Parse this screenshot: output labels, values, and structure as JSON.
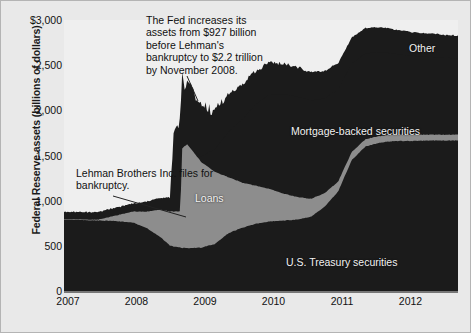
{
  "chart_data": {
    "type": "area",
    "title": "",
    "xlabel": "",
    "ylabel": "Federal Reserve assets (billions of dollars)",
    "ylim": [
      0,
      3000
    ],
    "yticks": [
      "0",
      "500",
      "1,000",
      "1,500",
      "2,000",
      "2,500",
      "$3,000"
    ],
    "ytick_values": [
      0,
      500,
      1000,
      1500,
      2000,
      2500,
      3000
    ],
    "xlim": [
      2007,
      2012.75
    ],
    "xticks": [
      "2007",
      "2008",
      "2009",
      "2010",
      "2011",
      "2012"
    ],
    "xtick_values": [
      2007,
      2008,
      2009,
      2010,
      2011,
      2012
    ],
    "grid": false,
    "legend_position": "inline-labels",
    "stacking": "stacked-area",
    "colors": {
      "us_treasury_securities": "#1b1b1b",
      "loans": "#8d8d8d",
      "mortgage_backed_securities": "#1b1b1b",
      "other": "#1b1b1b",
      "background": "#e9e9e9",
      "plot_background": "#efefef",
      "text": "#111111",
      "series_label_text": "#f2f2f2"
    },
    "series": [
      {
        "name": "U.S. Treasury securities",
        "x": [
          2007.0,
          2007.25,
          2007.5,
          2007.75,
          2008.0,
          2008.2,
          2008.4,
          2008.55,
          2008.7,
          2008.72,
          2008.8,
          2008.9,
          2009.0,
          2009.2,
          2009.4,
          2009.6,
          2009.8,
          2010.0,
          2010.2,
          2010.4,
          2010.6,
          2010.8,
          2011.0,
          2011.2,
          2011.4,
          2011.6,
          2011.8,
          2012.0,
          2012.3,
          2012.6,
          2012.75
        ],
        "values": [
          790,
          785,
          780,
          775,
          760,
          700,
          600,
          500,
          480,
          475,
          476,
          478,
          480,
          520,
          640,
          700,
          745,
          770,
          780,
          790,
          820,
          930,
          1100,
          1450,
          1600,
          1640,
          1660,
          1660,
          1665,
          1665,
          1665
        ]
      },
      {
        "name": "Loans",
        "x": [
          2007.0,
          2007.5,
          2007.75,
          2008.0,
          2008.2,
          2008.4,
          2008.55,
          2008.7,
          2008.72,
          2008.8,
          2008.9,
          2009.0,
          2009.2,
          2009.4,
          2009.6,
          2009.8,
          2010.0,
          2010.2,
          2010.4,
          2010.6,
          2010.8,
          2011.0,
          2011.2,
          2011.4,
          2011.6,
          2011.8,
          2012.0,
          2012.3,
          2012.6,
          2012.75
        ],
        "values": [
          5,
          10,
          60,
          120,
          180,
          300,
          380,
          400,
          1100,
          1150,
          1050,
          950,
          800,
          620,
          500,
          420,
          360,
          300,
          250,
          200,
          150,
          110,
          90,
          80,
          75,
          70,
          68,
          65,
          65,
          65
        ]
      },
      {
        "name": "Mortgage-backed securities",
        "x": [
          2007.0,
          2008.0,
          2008.7,
          2008.9,
          2009.0,
          2009.2,
          2009.4,
          2009.6,
          2009.8,
          2010.0,
          2010.2,
          2010.4,
          2010.6,
          2010.8,
          2011.0,
          2011.2,
          2011.4,
          2011.6,
          2011.8,
          2012.0,
          2012.3,
          2012.6,
          2012.75
        ],
        "values": [
          0,
          0,
          0,
          20,
          60,
          250,
          500,
          700,
          900,
          1050,
          1100,
          1110,
          1090,
          1050,
          1020,
          980,
          950,
          930,
          900,
          880,
          860,
          850,
          845
        ]
      },
      {
        "name": "Other",
        "x": [
          2007.0,
          2007.5,
          2008.0,
          2008.3,
          2008.55,
          2008.6,
          2008.7,
          2008.75,
          2008.85,
          2008.95,
          2009.05,
          2009.15,
          2009.3,
          2009.5,
          2009.7,
          2009.9,
          2010.1,
          2010.3,
          2010.5,
          2010.7,
          2010.9,
          2011.05,
          2011.2,
          2011.4,
          2011.6,
          2011.8,
          2012.0,
          2012.3,
          2012.6,
          2012.75
        ],
        "values": [
          80,
          85,
          90,
          120,
          150,
          900,
          1000,
          620,
          700,
          560,
          520,
          450,
          420,
          400,
          380,
          360,
          340,
          330,
          320,
          310,
          300,
          290,
          285,
          280,
          275,
          270,
          265,
          260,
          255,
          250
        ]
      }
    ],
    "totals_note": [
      {
        "x": 2008.6,
        "total": 2200,
        "label": "peak after Lehman bankruptcy"
      },
      {
        "x": 2007.0,
        "total": 875,
        "label": "pre-crisis level"
      }
    ],
    "annotations": [
      {
        "name": "fed-increase-annotation",
        "text": "The Fed increases its assets from  $927 billion before Lehman's bankruptcy to $2.2 trillion by November 2008."
      },
      {
        "name": "lehman-bankruptcy-annotation",
        "text": "Lehman Brothers Inc. files for bankruptcy."
      }
    ],
    "series_labels": {
      "loans": "Loans",
      "mbs": "Mortgage-backed securities",
      "other": "Other",
      "ust": "U.S. Treasury securities"
    }
  }
}
